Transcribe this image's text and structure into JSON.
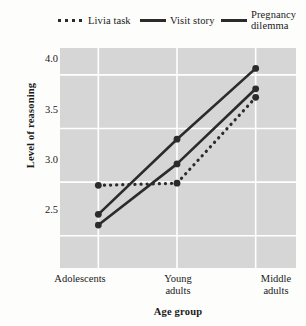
{
  "chart_data": {
    "type": "line",
    "title": "",
    "xlabel": "Age group",
    "ylabel": "Level of reasoning",
    "categories": [
      "Adolescents",
      "Young adults",
      "Middle adults"
    ],
    "category_lines": [
      [
        "Adolescents"
      ],
      [
        "Young",
        "adults"
      ],
      [
        "Middle",
        "adults"
      ]
    ],
    "yticks": [
      2.5,
      3.0,
      3.5,
      4.0
    ],
    "ytick_labels": [
      "2.5",
      "3.0",
      "3.5",
      "4.0"
    ],
    "ylim": [
      2.2,
      4.25
    ],
    "grid": true,
    "grid_color": "#ffffff",
    "plot_background": "#d6d6d6",
    "line_color": "#2b2b2b",
    "legend_position": "top",
    "series": [
      {
        "name": "Livia task",
        "style": "dotted",
        "values": [
          2.97,
          2.99,
          3.79
        ]
      },
      {
        "name": "Visit story",
        "style": "solid",
        "values": [
          2.6,
          3.17,
          3.87
        ]
      },
      {
        "name": "Pregnancy dilemma",
        "style": "solid",
        "values": [
          2.7,
          3.4,
          4.06
        ]
      }
    ]
  },
  "legend": {
    "entries": [
      {
        "label": "Livia task",
        "style": "dotted"
      },
      {
        "label": "Visit story",
        "style": "solid"
      },
      {
        "label_line1": "Pregnancy",
        "label_line2": "dilemma",
        "style": "solid"
      }
    ]
  },
  "axes": {
    "y_title": "Level of reasoning",
    "x_title": "Age group",
    "y_labels": [
      "4.0",
      "3.5",
      "3.0",
      "2.5"
    ],
    "x_labels": {
      "first": "Adolescents",
      "second_line1": "Young",
      "second_line2": "adults",
      "third_line1": "Middle",
      "third_line2": "adults"
    }
  }
}
